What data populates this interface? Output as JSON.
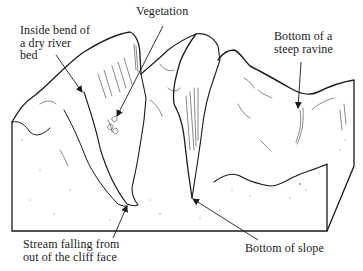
{
  "diagram": {
    "type": "landscape-block-diagram",
    "colors": {
      "ink": "#1a1a1a",
      "background": "#ffffff"
    },
    "labels": [
      {
        "id": "inside-bend",
        "text": "Inside bend of\na dry river\nbed",
        "x": 20,
        "y": 26,
        "arrow_to": [
          82,
          92
        ]
      },
      {
        "id": "vegetation",
        "text": "Vegetation",
        "x": 136,
        "y": 7,
        "arrow_to": [
          116,
          116
        ]
      },
      {
        "id": "ravine-bottom",
        "text": "Bottom of a\nsteep ravine",
        "x": 274,
        "y": 30,
        "arrow_to": [
          297,
          108
        ]
      },
      {
        "id": "stream",
        "text": "Stream falling from\nout of the cliff face",
        "x": 23,
        "y": 240,
        "arrow_to": [
          127,
          206
        ]
      },
      {
        "id": "slope-bottom",
        "text": "Bottom of slope",
        "x": 245,
        "y": 243,
        "arrow_to": [
          192,
          198
        ]
      }
    ]
  }
}
